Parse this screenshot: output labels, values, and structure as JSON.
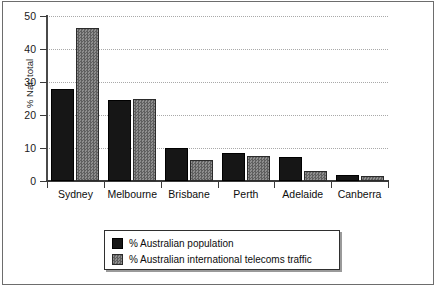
{
  "chart_data": {
    "type": "bar",
    "title": "",
    "xlabel": "",
    "ylabel": "% Nat. total",
    "ylim": [
      0,
      50
    ],
    "yticks": [
      0,
      10,
      20,
      30,
      40,
      50
    ],
    "ytick_labels": [
      "0",
      "10",
      "20",
      "30",
      "40",
      "50"
    ],
    "grid": true,
    "legend_position": "bottom-center",
    "categories": [
      "Sydney",
      "Melbourne",
      "Brisbane",
      "Perth",
      "Adelaide",
      "Canberra"
    ],
    "series": [
      {
        "name": "% Australian population",
        "color": "#161616",
        "values": [
          28,
          24.5,
          10,
          8.5,
          7.3,
          1.8
        ]
      },
      {
        "name": "% Australian international telecoms traffic",
        "color": "#7d7d7d",
        "values": [
          46.5,
          25,
          6.5,
          7.7,
          3,
          1.6
        ]
      }
    ]
  },
  "legend": {
    "entries": [
      {
        "label": "% Australian population"
      },
      {
        "label": "% Australian international telecoms traffic"
      }
    ]
  }
}
